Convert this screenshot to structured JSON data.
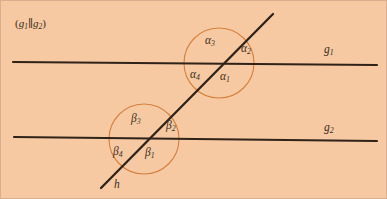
{
  "figure": {
    "title_note": "(g1||g2)",
    "background_color": "#f6c9a2",
    "line_color": "#2f2218",
    "circle_color": "#d4803f",
    "label_color": "#3a2b20"
  },
  "condition": {
    "open_paren": "(",
    "first_line": "g",
    "first_sub": "1",
    "parallel_symbol": "∥",
    "second_line": "g",
    "second_sub": "2",
    "close_paren": ")"
  },
  "lines": [
    {
      "name": "g1",
      "label_base": "g",
      "label_sub": "1",
      "role": "parallel-line-upper"
    },
    {
      "name": "g2",
      "label_base": "g",
      "label_sub": "2",
      "role": "parallel-line-lower"
    },
    {
      "name": "h",
      "label_base": "h",
      "label_sub": "",
      "role": "transversal"
    }
  ],
  "angles_upper": [
    {
      "id": "alpha1",
      "base": "α",
      "sub": "1",
      "position": "lower-right"
    },
    {
      "id": "alpha2",
      "base": "α",
      "sub": "2",
      "position": "upper-right"
    },
    {
      "id": "alpha3",
      "base": "α",
      "sub": "3",
      "position": "upper-left"
    },
    {
      "id": "alpha4",
      "base": "α",
      "sub": "4",
      "position": "lower-left"
    }
  ],
  "angles_lower": [
    {
      "id": "beta1",
      "base": "β",
      "sub": "1",
      "position": "lower-right"
    },
    {
      "id": "beta2",
      "base": "β",
      "sub": "2",
      "position": "upper-right"
    },
    {
      "id": "beta3",
      "base": "β",
      "sub": "3",
      "position": "upper-left"
    },
    {
      "id": "beta4",
      "base": "β",
      "sub": "4",
      "position": "lower-left"
    }
  ],
  "geometry": {
    "g1_start": [
      12,
      61
    ],
    "g1_end": [
      376,
      64
    ],
    "g2_start": [
      13,
      136
    ],
    "g2_end": [
      376,
      140
    ],
    "h_start": [
      272,
      13
    ],
    "h_end": [
      100,
      187
    ],
    "circle_upper_center": [
      218,
      62
    ],
    "circle_upper_radius": 35,
    "circle_lower_center": [
      143,
      138
    ],
    "circle_lower_radius": 35
  }
}
